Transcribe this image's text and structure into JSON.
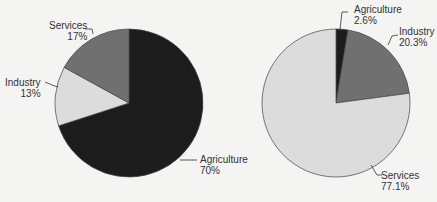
{
  "chart_data": [
    {
      "type": "pie",
      "title": "",
      "center": [
        129,
        103
      ],
      "radius": 74,
      "start_angle_deg": 0,
      "direction": "clockwise",
      "slices": [
        {
          "label": "Agriculture",
          "value": 70,
          "display": "70%",
          "color": "#1c1c1c"
        },
        {
          "label": "Industry",
          "value": 13,
          "display": "13%",
          "color": "#dcdcdc"
        },
        {
          "label": "Services",
          "value": 17,
          "display": "17%",
          "color": "#707070"
        }
      ]
    },
    {
      "type": "pie",
      "title": "",
      "center": [
        336,
        103
      ],
      "radius": 74,
      "start_angle_deg": 0,
      "direction": "clockwise",
      "slices": [
        {
          "label": "Agriculture",
          "value": 2.6,
          "display": "2.6%",
          "color": "#1c1c1c"
        },
        {
          "label": "Industry",
          "value": 20.3,
          "display": "20.3%",
          "color": "#707070"
        },
        {
          "label": "Services",
          "value": 77.1,
          "display": "77.1%",
          "color": "#dcdcdc"
        }
      ]
    }
  ],
  "labels": {
    "left": {
      "services": {
        "name": "Services",
        "pct": "17%"
      },
      "industry": {
        "name": "Industry",
        "pct": "13%"
      },
      "agriculture": {
        "name": "Agriculture",
        "pct": "70%"
      }
    },
    "right": {
      "agriculture": {
        "name": "Agriculture",
        "pct": "2.6%"
      },
      "industry": {
        "name": "Industry",
        "pct": "20.3%"
      },
      "services": {
        "name": "Services",
        "pct": "77.1%"
      }
    }
  }
}
